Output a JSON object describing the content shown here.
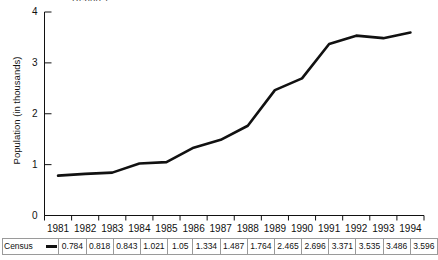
{
  "caption_fragment": "Report.)",
  "chart_data": {
    "type": "line",
    "title": "",
    "xlabel": "",
    "ylabel": "Population (in thousands)",
    "categories": [
      "1981",
      "1982",
      "1983",
      "1984",
      "1985",
      "1986",
      "1987",
      "1988",
      "1989",
      "1990",
      "1991",
      "1992",
      "1993",
      "1994"
    ],
    "series": [
      {
        "name": "Census",
        "values": [
          0.784,
          0.818,
          0.843,
          1.021,
          1.05,
          1.334,
          1.487,
          1.764,
          2.465,
          2.696,
          3.371,
          3.535,
          3.486,
          3.596
        ]
      }
    ],
    "ylim": [
      0,
      4
    ],
    "yticks": [
      0,
      1,
      2,
      3,
      4
    ],
    "ytick_labels": [
      "0",
      "1",
      "2",
      "3",
      "4"
    ],
    "grid": false,
    "legend_position": "table-row",
    "line_color": "#111111"
  },
  "table": {
    "row_label": "Census",
    "marker": "line-segment",
    "values": [
      "0.784",
      "0.818",
      "0.843",
      "1.021",
      "1.05",
      "1.334",
      "1.487",
      "1.764",
      "2.465",
      "2.696",
      "3.371",
      "3.535",
      "3.486",
      "3.596"
    ]
  }
}
